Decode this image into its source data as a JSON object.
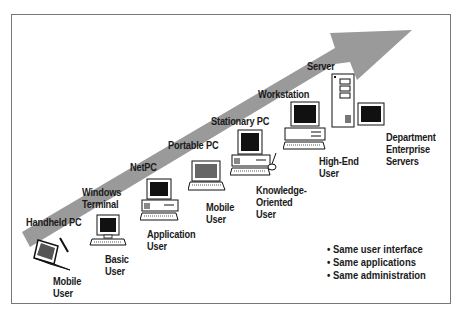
{
  "diagram": {
    "arrow": {
      "color": "#9a9a9a",
      "direction": "up-right",
      "meaning": "scalability continuum"
    },
    "platforms": [
      {
        "label": "Handheld PC"
      },
      {
        "label": "Windows\nTerminal"
      },
      {
        "label": "NetPC"
      },
      {
        "label": "Portable PC"
      },
      {
        "label": "Stationary PC"
      },
      {
        "label": "Workstation"
      },
      {
        "label": "Server"
      }
    ],
    "users": [
      {
        "label": "Mobile\nUser",
        "icon": "handheld-pc-icon"
      },
      {
        "label": "Basic\nUser",
        "icon": "terminal-icon"
      },
      {
        "label": "Application\nUser",
        "icon": "desktop-pc-icon"
      },
      {
        "label": "Mobile\nUser",
        "icon": "laptop-icon"
      },
      {
        "label": "Knowledge-\nOriented\nUser",
        "icon": "desktop-pc-mouse-icon"
      },
      {
        "label": "High-End\nUser",
        "icon": "workstation-icon"
      },
      {
        "label": "Department\nEnterprise\nServers",
        "icon": "server-tower-icon"
      }
    ],
    "bullets": [
      "• Same user interface",
      "• Same applications",
      "• Same administration"
    ]
  }
}
